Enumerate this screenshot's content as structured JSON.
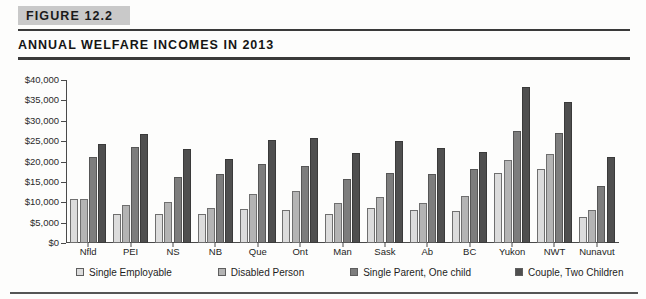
{
  "figure": {
    "badge": "FIGURE 12.2",
    "title": "ANNUAL WELFARE INCOMES IN 2013"
  },
  "chart_data": {
    "type": "bar",
    "title": "ANNUAL WELFARE INCOMES IN 2013",
    "xlabel": "",
    "ylabel": "",
    "ylim": [
      0,
      40000
    ],
    "ytick_labels": [
      "$40,000",
      "$35,000",
      "$30,000",
      "$25,000",
      "$20,000",
      "$15,000",
      "$10,000",
      "$5,000",
      "$0"
    ],
    "ytick_values": [
      40000,
      35000,
      30000,
      25000,
      20000,
      15000,
      10000,
      5000,
      0
    ],
    "grid": false,
    "legend_position": "bottom",
    "categories": [
      "Nfld",
      "PEI",
      "NS",
      "NB",
      "Que",
      "Ont",
      "Man",
      "Sask",
      "Ab",
      "BC",
      "Yukon",
      "NWT",
      "Nunavut"
    ],
    "series": [
      {
        "name": "Single Employable",
        "color": "#dcdcdc",
        "values": [
          10800,
          7200,
          7000,
          7000,
          8400,
          8200,
          7200,
          8700,
          8000,
          7800,
          17100,
          18200,
          6500
        ]
      },
      {
        "name": "Disabled Person",
        "color": "#b4b4b4",
        "values": [
          10800,
          9400,
          10000,
          8700,
          12000,
          12800,
          9700,
          11200,
          9800,
          11600,
          20300,
          21900,
          8100
        ]
      },
      {
        "name": "Single Parent, One child",
        "color": "#7d7d7d",
        "values": [
          21000,
          23600,
          16300,
          16900,
          19400,
          18900,
          15700,
          17200,
          17000,
          18100,
          27500,
          27000,
          14000
        ]
      },
      {
        "name": "Couple, Two Children",
        "color": "#4f4f4f",
        "values": [
          24300,
          26700,
          23000,
          20700,
          25300,
          25700,
          22000,
          25000,
          23400,
          22300,
          38200,
          34500,
          21000
        ]
      }
    ]
  },
  "legend": [
    {
      "label": "Single Employable",
      "swatch": "#dcdcdc"
    },
    {
      "label": "Disabled Person",
      "swatch": "#b4b4b4"
    },
    {
      "label": "Single Parent, One child",
      "swatch": "#7d7d7d"
    },
    {
      "label": "Couple, Two Children",
      "swatch": "#4f4f4f"
    }
  ]
}
